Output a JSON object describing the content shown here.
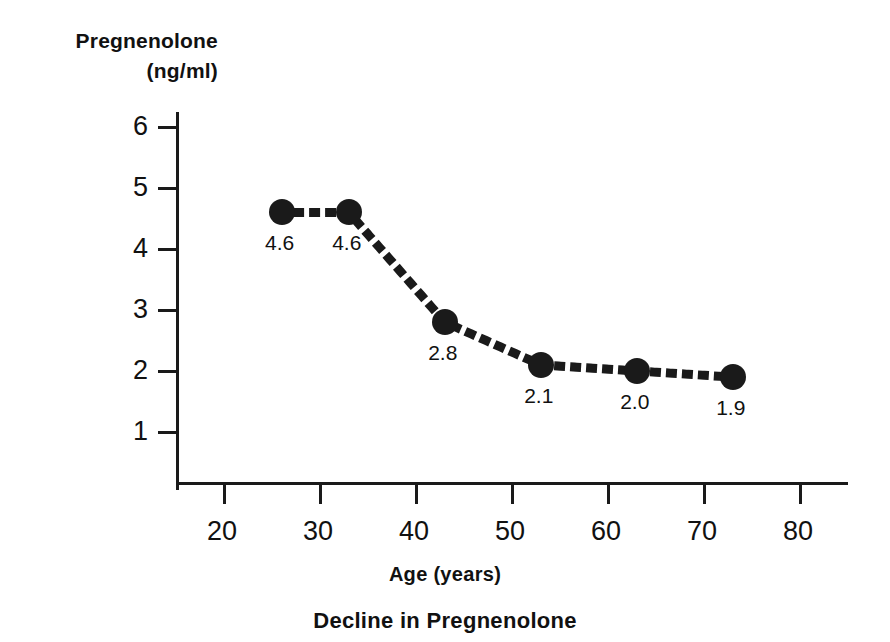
{
  "chart_data": {
    "type": "line",
    "title": "Decline in Pregnenolone",
    "xlabel": "Age (years)",
    "ylabel": "Pregnenolone (ng/ml)",
    "ylabel_lines": [
      "Pregnenolone",
      "(ng/ml)"
    ],
    "x": [
      26,
      33,
      43,
      53,
      63,
      73
    ],
    "values": [
      4.6,
      4.6,
      2.8,
      2.1,
      2.0,
      1.9
    ],
    "point_labels": [
      "4.6",
      "4.6",
      "2.8",
      "2.1",
      "2.0",
      "1.9"
    ],
    "xlim": [
      15,
      85
    ],
    "ylim": [
      0,
      6.5
    ],
    "xticks": [
      20,
      30,
      40,
      50,
      60,
      70,
      80
    ],
    "xtick_labels": [
      "20",
      "30",
      "40",
      "50",
      "60",
      "70",
      "80"
    ],
    "yticks": [
      1,
      2,
      3,
      4,
      5,
      6
    ],
    "ytick_labels": [
      "1",
      "2",
      "3",
      "4",
      "5",
      "6"
    ],
    "grid": false,
    "legend": "none",
    "line_style": "dotted",
    "marker": "filled-circle",
    "series_color": "#1a1a1a",
    "background_color": "#ffffff"
  },
  "axes": {
    "y_label_line1": "Pregnenolone",
    "y_label_line2": "(ng/ml)"
  }
}
